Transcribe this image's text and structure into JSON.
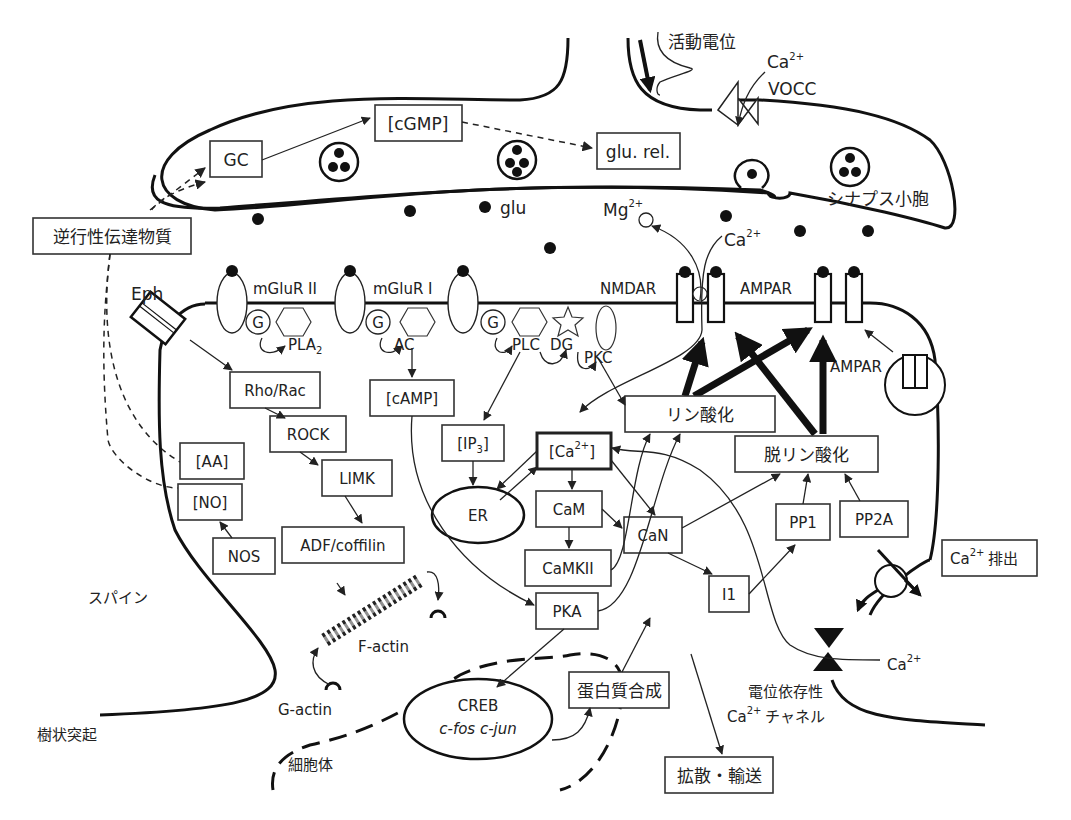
{
  "presynaptic": {
    "action_potential": "活動電位",
    "ca_label": "Ca",
    "ca_sup": "2+",
    "vocc": "VOCC",
    "gc": "GC",
    "cgmp": "[cGMP]",
    "glu_rel": "glu. rel.",
    "synaptic_vesicle": "シナプス小胞"
  },
  "cleft": {
    "glu": "glu",
    "mg": "Mg",
    "mg_sup": "2+",
    "ca": "Ca",
    "ca_sup": "2+"
  },
  "retrograde": "逆行性伝達物質",
  "membrane": {
    "eph": "Eph",
    "mglur2": "mGluR II",
    "mglur1": "mGluR I",
    "g": "G",
    "pla2": "PLA",
    "pla2_sub": "2",
    "ac": "AC",
    "plc": "PLC",
    "dg": "DG",
    "pkc": "PKC",
    "nmdar": "NMDAR",
    "ampar": "AMPAR",
    "ampar_vesicle": "AMPAR"
  },
  "spine": {
    "rho_rac": "Rho/Rac",
    "rock": "ROCK",
    "limk": "LIMK",
    "adf_cofilin": "ADF/coffilin",
    "aa": "[AA]",
    "no": "[NO]",
    "nos": "NOS",
    "camp": "[cAMP]",
    "ip3": "[IP",
    "ip3_sub": "3",
    "ip3_close": "]",
    "er": "ER",
    "ca_pool": "[Ca",
    "ca_pool_sup": "2+",
    "ca_pool_close": "]",
    "cam": "CaM",
    "camkii": "CaMKII",
    "pka": "PKA",
    "can": "CaN",
    "i1": "I1",
    "pp1": "PP1",
    "pp2a": "PP2A",
    "phosphorylation": "リン酸化",
    "dephosphorylation": "脱リン酸化",
    "ca_extrusion": "排出",
    "ca_extrusion_ca": "Ca",
    "ca_extrusion_sup": "2+",
    "f_actin": "F-actin",
    "g_actin": "G-actin",
    "spine_label": "スパイン"
  },
  "soma": {
    "dendrite": "樹状突起",
    "cell_body": "細胞体",
    "creb": "CREB",
    "genes": "c-fos c-jun",
    "protein_synthesis": "蛋白質合成",
    "diffusion_transport": "拡散・輸送",
    "vdcc_line1": "電位依存性",
    "vdcc_ca": "Ca",
    "vdcc_sup": "2+",
    "vdcc_line2": "チャネル",
    "ca_influx": "Ca",
    "ca_influx_sup": "2+"
  }
}
